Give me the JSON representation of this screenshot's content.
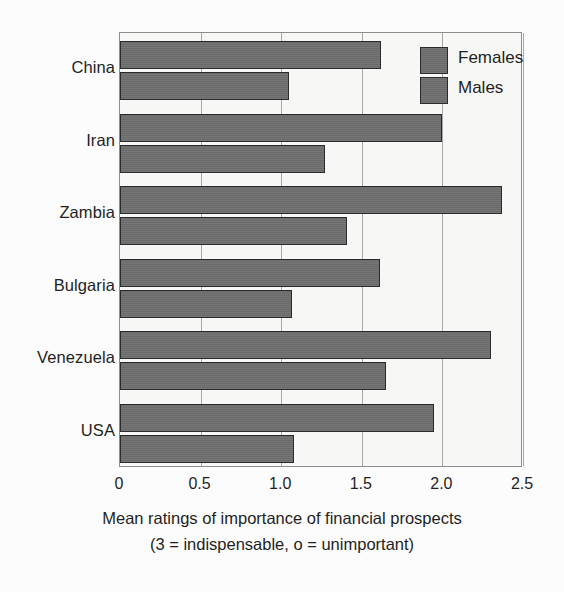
{
  "chart_data": {
    "type": "bar",
    "orientation": "horizontal",
    "title": "",
    "xlabel": "Mean ratings of importance of financial prospects",
    "xlabel_note": "(3 = indispensable, o = unimportant)",
    "ylabel": "",
    "categories": [
      "China",
      "Iran",
      "Zambia",
      "Bulgaria",
      "Venezuela",
      "USA"
    ],
    "series": [
      {
        "name": "Females",
        "values": [
          1.62,
          2.0,
          2.37,
          1.61,
          2.3,
          1.95
        ]
      },
      {
        "name": "Males",
        "values": [
          1.05,
          1.27,
          1.41,
          1.07,
          1.65,
          1.08
        ]
      }
    ],
    "xlim": [
      0,
      2.5
    ],
    "xticks": [
      0,
      0.5,
      1.0,
      1.5,
      2.0,
      2.5
    ],
    "xticklabels": [
      "0",
      "0.5",
      "1.0",
      "1.5",
      "2.0",
      "2.5"
    ],
    "grid": "vertical",
    "legend_position": "top-right-inside",
    "colors": {
      "bar_fill": "#6e6e6e",
      "bar_edge": "#2b2b2b",
      "plot_background": "#f7f7f5",
      "gridline": "#a8a8a8",
      "axis_border": "#8d8d8d",
      "text": "#1f1f1f"
    }
  },
  "legend": {
    "items": [
      {
        "label": "Females"
      },
      {
        "label": "Males"
      }
    ]
  },
  "axis": {
    "tick_labels": [
      "0",
      "0.5",
      "1.0",
      "1.5",
      "2.0",
      "2.5"
    ],
    "caption_line_1": "Mean ratings of importance of financial prospects",
    "caption_line_2": "(3 = indispensable, o = unimportant)"
  }
}
